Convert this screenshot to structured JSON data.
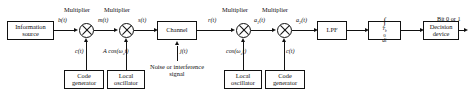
{
  "diagram": {
    "blocks": {
      "information_source": "Information\nsource",
      "information_source_line1": "Information",
      "information_source_line2": "source",
      "code_generator_tx_line1": "Code",
      "code_generator_tx_line2": "generator",
      "local_oscillator_tx_line1": "Local",
      "local_oscillator_tx_line2": "oscillator",
      "channel": "Channel",
      "local_oscillator_rx_line1": "Local",
      "local_oscillator_rx_line2": "oscillator",
      "code_generator_rx_line1": "Code",
      "code_generator_rx_line2": "generator",
      "lpf": "LPF",
      "integrator_symbol": "∫",
      "integrator_lower_limit": "0",
      "integrator_upper_limit": "Tb",
      "integrator_differential": "dt",
      "decision_device_line1": "Decision",
      "decision_device_line2": "device"
    },
    "multiplier_captions": {
      "mult1": "Multiplier",
      "mult2": "Multiplier",
      "mult3": "Multiplier",
      "mult4": "Multiplier"
    },
    "signal_labels": {
      "b_t": "b(t)",
      "m_t": "m(t)",
      "s_t": "s(t)",
      "r_t": "r(t)",
      "a1_t": "a1(t)",
      "a2_t": "a2(t)",
      "c_t_tx": "c(t)",
      "a_cos_tx": "A cos(ωct)",
      "j_t": "j(t)",
      "cos_rx": "cos(ωct)",
      "c_t_rx": "c(t)",
      "output": "Bit 0 or 1"
    },
    "annotations": {
      "noise_line1": "Noise or",
      "noise_line2": "interference",
      "noise_line3": "signal"
    },
    "colors": {
      "stroke": "#111111",
      "background": "#ffffff"
    }
  }
}
